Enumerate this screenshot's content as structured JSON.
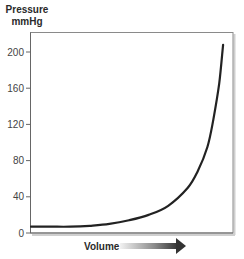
{
  "chart_data": {
    "type": "line",
    "title": "",
    "ylabel_line1": "Pressure",
    "ylabel_line2": "mmHg",
    "xlabel": "Volume",
    "x_axis_arrow": true,
    "yticks": [
      0,
      40,
      80,
      120,
      160,
      200
    ],
    "ytick_labels": [
      "0",
      "40",
      "80",
      "120",
      "160",
      "200"
    ],
    "ylim": [
      0,
      220
    ],
    "grid": false,
    "legend": null,
    "series": [
      {
        "name": "Pressure-Volume curve",
        "color": "#222222",
        "x": [
          0,
          0.1,
          0.2,
          0.3,
          0.4,
          0.5,
          0.6,
          0.7,
          0.8,
          0.85,
          0.9,
          0.93,
          0.96,
          0.98
        ],
        "values": [
          7,
          7,
          7,
          8,
          10,
          14,
          20,
          30,
          50,
          68,
          95,
          125,
          165,
          208
        ]
      }
    ],
    "colors": {
      "curve": "#222222",
      "axis": "#666666",
      "frame": "#888888"
    }
  }
}
